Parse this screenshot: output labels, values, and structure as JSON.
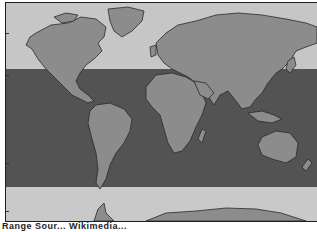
{
  "map": {
    "type": "world-map-zones",
    "projection": "equirectangular",
    "zones": [
      {
        "name": "northern-zone",
        "color": "#c6c6c6"
      },
      {
        "name": "tropical-zone",
        "color": "#535353"
      },
      {
        "name": "southern-zone",
        "color": "#c9c9c9"
      }
    ],
    "land_color": "#8c8c8c",
    "coast_color": "#2a2a2a",
    "caption": "Range  Sour...  Wikimedia..."
  }
}
